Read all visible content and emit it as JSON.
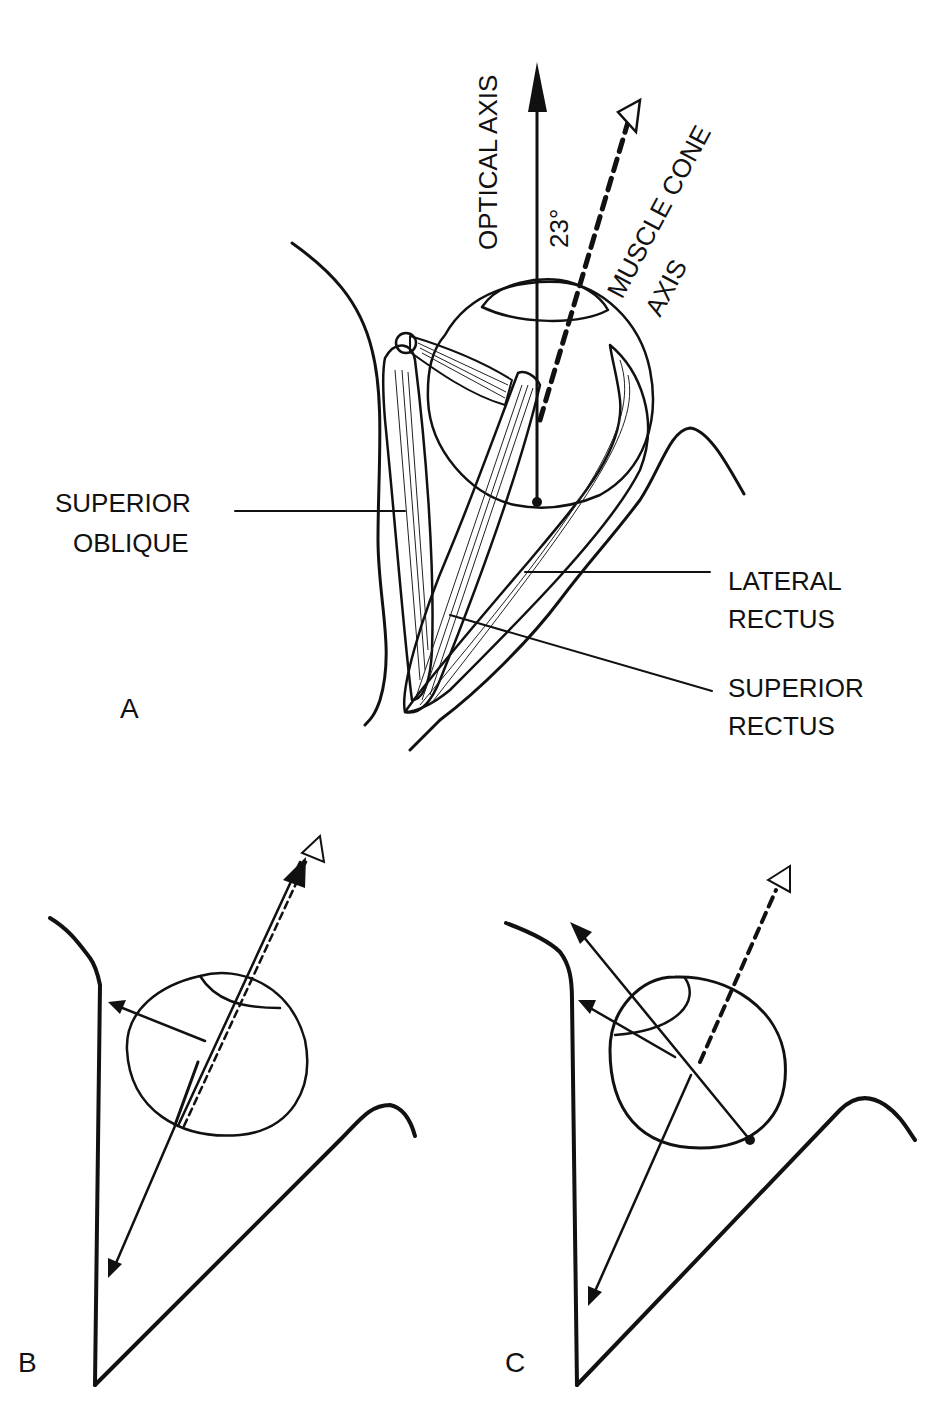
{
  "figure": {
    "panels": [
      {
        "id": "A",
        "label": "A"
      },
      {
        "id": "B",
        "label": "B"
      },
      {
        "id": "C",
        "label": "C"
      }
    ],
    "panel_a": {
      "optical_axis_label": "OPTICAL AXIS",
      "muscle_cone_label_line1": "MUSCLE CONE",
      "muscle_cone_label_line2": "AXIS",
      "angle_label": "23°",
      "muscles": {
        "superior_oblique": [
          "SUPERIOR",
          "OBLIQUE"
        ],
        "lateral_rectus": [
          "LATERAL",
          "RECTUS"
        ],
        "superior_rectus": [
          "SUPERIOR",
          "RECTUS"
        ]
      }
    }
  }
}
